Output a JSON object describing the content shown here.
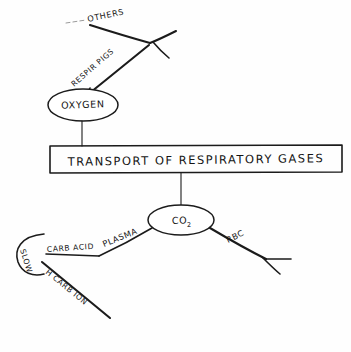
{
  "canvas": {
    "width": 351,
    "height": 352,
    "background_color": "#fefefe",
    "ink_color": "#1b1b1b",
    "faint_ink_color": "#9a9a9a",
    "style": "hand-drawn pencil concept map"
  },
  "diagram": {
    "title": "TRANSPORT OF RESPIRATORY GASES",
    "central_box": {
      "label": "TRANSPORT OF RESPIRATORY GASES",
      "shape": "rectangle"
    },
    "nodes": [
      {
        "id": "oxygen",
        "label": "OXYGEN",
        "shape": "ellipse"
      },
      {
        "id": "co2",
        "label": "CO",
        "subscript": "2",
        "shape": "ellipse"
      }
    ],
    "edge_labels": [
      {
        "id": "respir-pigs",
        "label": "RESPIR PIGS"
      },
      {
        "id": "others",
        "label": "OTHERS"
      },
      {
        "id": "plasma",
        "label": "PLASMA"
      },
      {
        "id": "carb-acid",
        "label": "CARB ACID"
      },
      {
        "id": "h-carb-ion",
        "label": "H CARB ION"
      },
      {
        "id": "rbc",
        "label": "RBC"
      },
      {
        "id": "slow",
        "label": "SLOW"
      }
    ]
  }
}
